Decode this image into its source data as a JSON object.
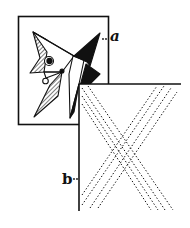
{
  "figure": {
    "colors": {
      "ink": "#111111",
      "paper": "#ffffff"
    },
    "panels": [
      {
        "id": "a",
        "label": "..a",
        "content": "cubist-style angular face composition with hatched and solid black triangles"
      },
      {
        "id": "b",
        "label": "b..",
        "content": "large X formed by parallel dotted diagonal lines"
      }
    ]
  }
}
